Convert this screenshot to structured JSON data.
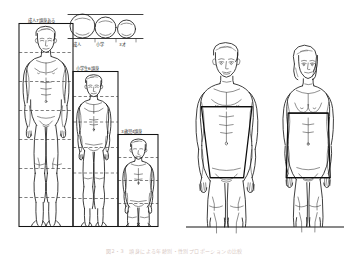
{
  "figure": {
    "background_color": "#ffffff",
    "ink_color": "#1a1a1a",
    "caption": "図2・3　頭身による年齢別・性別プロポーションの比較"
  },
  "left_panel": {
    "name": "growth-proportion-chart",
    "labels": {
      "adult_box": "成人7頭身ある",
      "child_box": "小学生6頭身",
      "toddler_box": "3歳児4頭身"
    },
    "head_row": {
      "label_left": "成人",
      "label_mid": "小学",
      "label_right": "3才",
      "counts": [
        1,
        1,
        1
      ]
    },
    "figures": [
      {
        "name": "adult-male-figure",
        "head_units": "7",
        "label": "成人7頭身ある"
      },
      {
        "name": "schoolchild-figure",
        "head_units": "6",
        "label": "小学生6頭身"
      },
      {
        "name": "toddler-figure",
        "head_units": "4",
        "label": "3歳児4頭身"
      }
    ]
  },
  "right_panel": {
    "name": "male-female-comparison",
    "figures": [
      {
        "name": "adult-male-figure",
        "overlay": "shoulder-wide-trapezoid"
      },
      {
        "name": "adult-female-figure",
        "overlay": "hip-wide-trapezoid"
      }
    ]
  }
}
